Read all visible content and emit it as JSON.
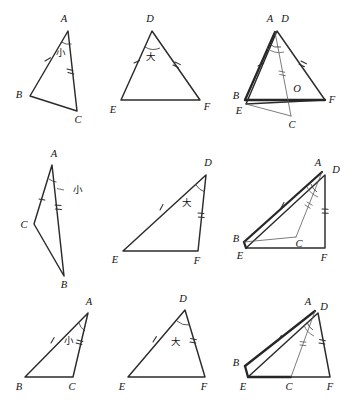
{
  "figure": {
    "title": "",
    "background_color": "#ffffff",
    "ink_color": "#2b2b2b",
    "width": 356,
    "height": 409,
    "columns": 3,
    "rows": 3
  },
  "labels": {
    "A": "A",
    "B": "B",
    "C": "C",
    "D": "D",
    "E": "E",
    "F": "F",
    "O": "O",
    "small": "小",
    "large": "大"
  },
  "panels": [
    {
      "id": "r1c1",
      "kind": "triangle-abc",
      "vertices": [
        {
          "name": "A",
          "x": 68,
          "y": 31
        },
        {
          "name": "B",
          "x": 30,
          "y": 96
        },
        {
          "name": "C",
          "x": 77,
          "y": 111
        }
      ],
      "angle_marked_at": "A",
      "angle_label": "小",
      "ticks": [
        {
          "side": "AB",
          "count": 1
        },
        {
          "side": "AC",
          "count": 2
        }
      ]
    },
    {
      "id": "r1c2",
      "kind": "triangle-def",
      "vertices": [
        {
          "name": "D",
          "x": 152,
          "y": 31
        },
        {
          "name": "E",
          "x": 121,
          "y": 100
        },
        {
          "name": "F",
          "x": 200,
          "y": 100
        }
      ],
      "angle_marked_at": "D",
      "angle_label": "大",
      "ticks": [
        {
          "side": "DE",
          "count": 1
        },
        {
          "side": "DF",
          "count": 2
        }
      ]
    },
    {
      "id": "r1c3",
      "kind": "overlay",
      "vertices": [
        {
          "name": "A",
          "x": 274,
          "y": 31
        },
        {
          "name": "D",
          "x": 277,
          "y": 31
        },
        {
          "name": "B",
          "x": 245,
          "y": 100
        },
        {
          "name": "E",
          "x": 246,
          "y": 104
        },
        {
          "name": "C",
          "x": 291,
          "y": 116
        },
        {
          "name": "F",
          "x": 325,
          "y": 100
        },
        {
          "name": "O",
          "x": 294,
          "y": 93
        }
      ],
      "angle_marked_at": "A",
      "angle_labels": [
        "小",
        "大"
      ],
      "intersection_label": "O",
      "ticks": [
        {
          "side": "AB",
          "count": 1
        },
        {
          "side": "DF",
          "count": 2
        },
        {
          "side": "AC",
          "count": 2
        }
      ]
    },
    {
      "id": "r2c1",
      "kind": "triangle-abc",
      "vertices": [
        {
          "name": "A",
          "x": 52,
          "y": 165
        },
        {
          "name": "C",
          "x": 34,
          "y": 224
        },
        {
          "name": "B",
          "x": 64,
          "y": 276
        }
      ],
      "angle_marked_at": "A",
      "angle_label": "小",
      "leader_line": true,
      "ticks": [
        {
          "side": "AC",
          "count": 1
        },
        {
          "side": "AB",
          "count": 2
        }
      ]
    },
    {
      "id": "r2c2",
      "kind": "triangle-def",
      "vertices": [
        {
          "name": "D",
          "x": 206,
          "y": 175
        },
        {
          "name": "E",
          "x": 123,
          "y": 251
        },
        {
          "name": "F",
          "x": 198,
          "y": 251
        }
      ],
      "angle_marked_at": "D",
      "angle_label": "大",
      "ticks": [
        {
          "side": "DE",
          "count": 1
        },
        {
          "side": "DF",
          "count": 2
        }
      ]
    },
    {
      "id": "r2c3",
      "kind": "overlay",
      "vertices": [
        {
          "name": "A",
          "x": 319,
          "y": 170
        },
        {
          "name": "D",
          "x": 330,
          "y": 175
        },
        {
          "name": "B",
          "x": 243,
          "y": 242
        },
        {
          "name": "E",
          "x": 246,
          "y": 248
        },
        {
          "name": "C",
          "x": 296,
          "y": 237
        },
        {
          "name": "F",
          "x": 325,
          "y": 248
        }
      ],
      "angle_marked_at": "A",
      "angle_labels": [
        "小",
        "大"
      ],
      "ticks": [
        {
          "side": "AB",
          "count": 1
        },
        {
          "side": "AC",
          "count": 2
        },
        {
          "side": "DF",
          "count": 2
        }
      ]
    },
    {
      "id": "r3c1",
      "kind": "triangle-abc",
      "vertices": [
        {
          "name": "A",
          "x": 88,
          "y": 313
        },
        {
          "name": "B",
          "x": 25,
          "y": 377
        },
        {
          "name": "C",
          "x": 73,
          "y": 377
        }
      ],
      "angle_marked_at": "A",
      "angle_label": "小",
      "ticks": [
        {
          "side": "AB",
          "count": 1
        },
        {
          "side": "AC",
          "count": 2
        }
      ]
    },
    {
      "id": "r3c2",
      "kind": "triangle-def",
      "vertices": [
        {
          "name": "D",
          "x": 185,
          "y": 310
        },
        {
          "name": "E",
          "x": 128,
          "y": 377
        },
        {
          "name": "F",
          "x": 205,
          "y": 377
        }
      ],
      "angle_marked_at": "D",
      "angle_label": "大",
      "ticks": [
        {
          "side": "DE",
          "count": 1
        },
        {
          "side": "DF",
          "count": 2
        }
      ]
    },
    {
      "id": "r3c3",
      "kind": "overlay",
      "vertices": [
        {
          "name": "A",
          "x": 305,
          "y": 310
        },
        {
          "name": "D",
          "x": 318,
          "y": 313
        },
        {
          "name": "B",
          "x": 245,
          "y": 366
        },
        {
          "name": "E",
          "x": 248,
          "y": 377
        },
        {
          "name": "C",
          "x": 291,
          "y": 377
        },
        {
          "name": "F",
          "x": 330,
          "y": 377
        }
      ],
      "angle_marked_at": "A",
      "angle_labels": [
        "小",
        "大"
      ],
      "ticks": [
        {
          "side": "AB",
          "count": 1
        },
        {
          "side": "AC",
          "count": 2
        },
        {
          "side": "DF",
          "count": 2
        }
      ]
    }
  ]
}
